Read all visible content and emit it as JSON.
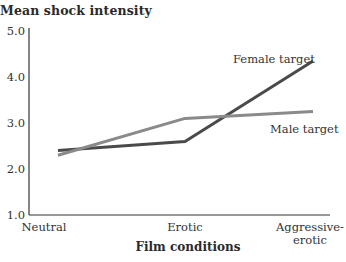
{
  "chart_data": {
    "type": "line",
    "title": "Mean shock intensity",
    "xlabel": "Film conditions",
    "ylabel": "Mean shock intensity",
    "categories": [
      "Neutral",
      "Erotic",
      "Aggressive-erotic"
    ],
    "category_lines": [
      [
        "Neutral"
      ],
      [
        "Erotic"
      ],
      [
        "Aggressive-",
        "erotic"
      ]
    ],
    "yticks": [
      "1.0",
      "2.0",
      "3.0",
      "4.0",
      "5.0"
    ],
    "ylim": [
      1.0,
      5.0
    ],
    "grid": false,
    "legend": "inline labels",
    "series": [
      {
        "name": "Female target",
        "color": "#4a4a4a",
        "values": [
          2.4,
          2.6,
          4.35
        ]
      },
      {
        "name": "Male target",
        "color": "#8a8a8a",
        "values": [
          2.3,
          3.1,
          3.25
        ]
      }
    ]
  }
}
